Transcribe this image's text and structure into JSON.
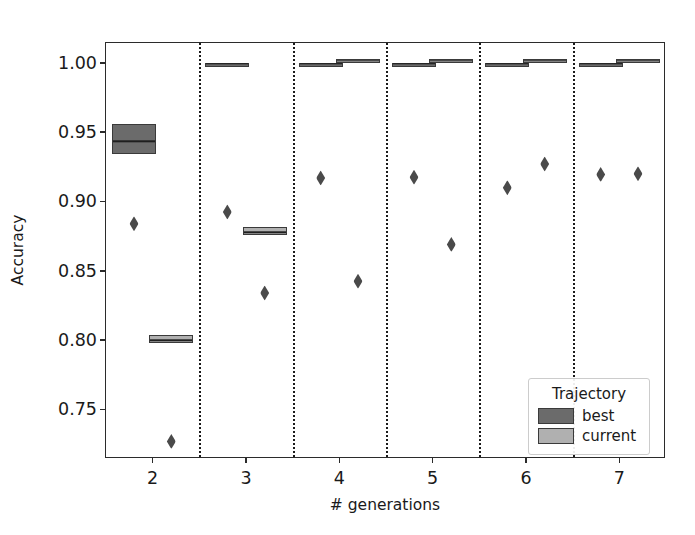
{
  "chart_data": {
    "type": "box",
    "title": "",
    "xlabel": "# generations",
    "ylabel": "Accuracy",
    "xlim": [
      1.5,
      7.5
    ],
    "ylim": [
      0.7143,
      1.0143
    ],
    "xticks": [
      "2",
      "3",
      "4",
      "5",
      "6",
      "7"
    ],
    "xtick_values": [
      2,
      3,
      4,
      5,
      6,
      7
    ],
    "yticks": [
      "0.75",
      "0.80",
      "0.85",
      "0.90",
      "0.95",
      "1.00"
    ],
    "ytick_values": [
      0.75,
      0.8,
      0.85,
      0.9,
      0.95,
      1.0
    ],
    "grid": false,
    "separators": [
      2.5,
      3.5,
      4.5,
      5.5,
      6.5
    ],
    "legend": {
      "title": "Trajectory",
      "position": "lower right",
      "entries": [
        {
          "name": "best",
          "color": "#6b6b6b"
        },
        {
          "name": "current",
          "color": "#b0b0b0"
        }
      ]
    },
    "series": [
      {
        "name": "best",
        "color": "#6b6b6b",
        "boxes": [
          {
            "x": 1.8,
            "q1": 0.934,
            "median": 0.944,
            "q3": 0.956,
            "whisker_low": 0.934,
            "whisker_high": 0.956,
            "fliers": [
              0.884
            ]
          },
          {
            "x": 2.8,
            "q1": 0.9995,
            "median": 1.0,
            "q3": 1.0,
            "whisker_low": 0.9995,
            "whisker_high": 1.0,
            "fliers": [
              0.8925
            ]
          },
          {
            "x": 3.8,
            "q1": 0.999,
            "median": 1.0,
            "q3": 1.0,
            "whisker_low": 0.999,
            "whisker_high": 1.0,
            "fliers": [
              0.917
            ]
          },
          {
            "x": 4.8,
            "q1": 0.999,
            "median": 1.0,
            "q3": 1.0,
            "whisker_low": 0.999,
            "whisker_high": 1.0,
            "fliers": [
              0.9175
            ]
          },
          {
            "x": 5.8,
            "q1": 0.999,
            "median": 1.0,
            "q3": 1.0,
            "whisker_low": 0.999,
            "whisker_high": 1.0,
            "fliers": [
              0.91
            ]
          },
          {
            "x": 6.8,
            "q1": 0.999,
            "median": 1.0,
            "q3": 1.0,
            "whisker_low": 0.999,
            "whisker_high": 1.0,
            "fliers": [
              0.9195
            ]
          }
        ]
      },
      {
        "name": "current",
        "color": "#b0b0b0",
        "boxes": [
          {
            "x": 2.2,
            "q1": 0.798,
            "median": 0.8005,
            "q3": 0.8035,
            "whisker_low": 0.798,
            "whisker_high": 0.8035,
            "fliers": [
              0.727
            ]
          },
          {
            "x": 3.2,
            "q1": 0.876,
            "median": 0.8785,
            "q3": 0.8815,
            "whisker_low": 0.876,
            "whisker_high": 0.8815,
            "fliers": [
              0.834
            ]
          },
          {
            "x": 4.2,
            "q1": 1.0,
            "median": 1.002,
            "q3": 1.003,
            "whisker_low": 1.0,
            "whisker_high": 1.003,
            "fliers": [
              0.8425
            ]
          },
          {
            "x": 5.2,
            "q1": 1.0,
            "median": 1.002,
            "q3": 1.003,
            "whisker_low": 1.0,
            "whisker_high": 1.003,
            "fliers": [
              0.869
            ]
          },
          {
            "x": 6.2,
            "q1": 1.0,
            "median": 1.002,
            "q3": 1.003,
            "whisker_low": 1.0,
            "whisker_high": 1.003,
            "fliers": [
              0.927
            ]
          },
          {
            "x": 7.2,
            "q1": 1.0,
            "median": 1.002,
            "q3": 1.003,
            "whisker_low": 1.0,
            "whisker_high": 1.003,
            "fliers": [
              0.92
            ]
          }
        ]
      }
    ]
  }
}
